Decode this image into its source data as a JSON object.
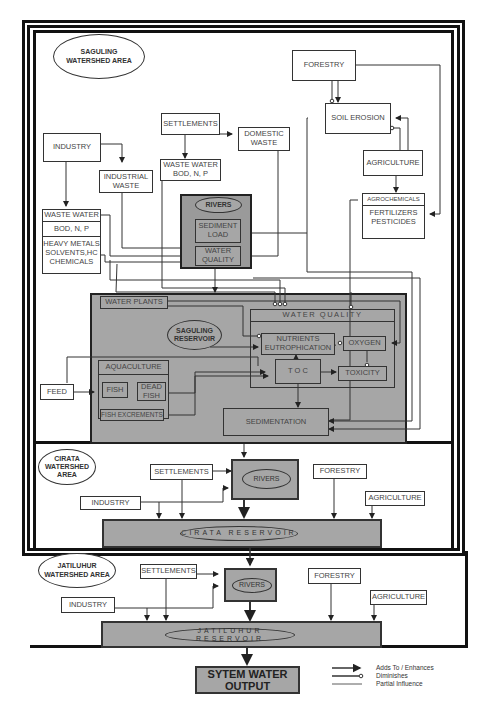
{
  "saguling": {
    "area_label": "SAGULING\nWATERSHED AREA",
    "forestry": "FORESTRY",
    "soil_erosion": "SOIL EROSION",
    "agriculture": "AGRICULTURE",
    "agrochemicals": "AGROCHEMICALS",
    "fertilizers": "FERTILIZERS\nPESTICIDES",
    "settlements": "SETTLEMENTS",
    "domestic_waste": "DOMESTIC\nWASTE",
    "waste_water_bod": "WASTE WATER\nBOD, N, P",
    "industry": "INDUSTRY",
    "industrial_waste": "INDUSTRIAL\nWASTE",
    "waste_water": "WASTE WATER",
    "bod": "BOD, N, P",
    "heavy_metals": "HEAVY METALS\nSOLVENTS,HC\nCHEMICALS",
    "rivers": "RIVERS",
    "sediment_load": "SEDIMENT\nLOAD",
    "water_quality_small": "WATER\nQUALITY",
    "water_plants": "WATER PLANTS",
    "reservoir": "SAGULING\nRESERVOIR",
    "water_quality": "WATER QUALITY",
    "nutrients": "NUTRIENTS\nEUTROPHICATION",
    "oxygen": "OXYGEN",
    "toc": "T O C",
    "toxicity": "TOXICITY",
    "aquaculture": "AQUACULTURE",
    "fish": "FISH",
    "dead_fish": "DEAD\nFISH",
    "fish_excrements": "FISH EXCREMENTS",
    "feed": "FEED",
    "sedimentation": "SEDIMENTATION"
  },
  "cirata": {
    "area_label": "CIRATA\nWATERSHED AREA",
    "settlements": "SETTLEMENTS",
    "industry": "INDUSTRY",
    "rivers": "RIVERS",
    "forestry": "FORESTRY",
    "agriculture": "AGRICULTURE",
    "reservoir": "CIRATA RESERVOIR"
  },
  "jatiluhur": {
    "area_label": "JATILUHUR\nWATERSHED AREA",
    "settlements": "SETTLEMENTS",
    "industry": "INDUSTRY",
    "rivers": "RIVERS",
    "forestry": "FORESTRY",
    "agriculture": "AGRICULTURE",
    "reservoir": "JATILUHUR RESERVOIR"
  },
  "output": {
    "label": "SYTEM WATER\nOUTPUT"
  },
  "legend": {
    "items": [
      {
        "label": "Adds To / Enhances",
        "type": "arrow"
      },
      {
        "label": "Diminishes",
        "type": "circle"
      },
      {
        "label": "Partial Influence",
        "type": "line"
      }
    ]
  }
}
